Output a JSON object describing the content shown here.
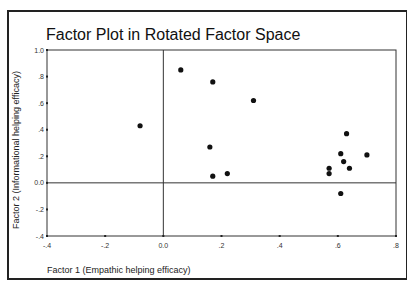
{
  "chart_data": {
    "type": "scatter",
    "title": "Factor Plot in Rotated Factor Space",
    "xlabel": "Factor 1 (Empathic helping efficacy)",
    "ylabel": "Factor 2 (Informational helping efficacy)",
    "xlim": [
      -0.4,
      0.8
    ],
    "ylim": [
      -0.4,
      1.0
    ],
    "x_ticks": [
      -0.4,
      -0.2,
      0.0,
      0.2,
      0.4,
      0.6,
      0.8
    ],
    "x_tick_labels": [
      "-.4",
      "-.2",
      "0.0",
      ".2",
      ".4",
      ".6",
      ".8"
    ],
    "y_ticks": [
      -0.4,
      -0.2,
      0.0,
      0.2,
      0.4,
      0.6,
      0.8,
      1.0
    ],
    "y_tick_labels": [
      "-.4",
      "-.2",
      "0.0",
      ".2",
      ".4",
      ".6",
      ".8",
      "1.0"
    ],
    "grid": false,
    "reference_lines": {
      "x": 0.0,
      "y": 0.0
    },
    "legend": null,
    "series": [
      {
        "name": "Items",
        "marker": "circle",
        "color": "#111111",
        "points": [
          {
            "x": -0.08,
            "y": 0.43
          },
          {
            "x": 0.06,
            "y": 0.85
          },
          {
            "x": 0.17,
            "y": 0.76
          },
          {
            "x": 0.31,
            "y": 0.62
          },
          {
            "x": 0.16,
            "y": 0.27
          },
          {
            "x": 0.17,
            "y": 0.05
          },
          {
            "x": 0.22,
            "y": 0.07
          },
          {
            "x": 0.63,
            "y": 0.37
          },
          {
            "x": 0.61,
            "y": 0.22
          },
          {
            "x": 0.7,
            "y": 0.21
          },
          {
            "x": 0.62,
            "y": 0.16
          },
          {
            "x": 0.64,
            "y": 0.11
          },
          {
            "x": 0.57,
            "y": 0.11
          },
          {
            "x": 0.57,
            "y": 0.07
          },
          {
            "x": 0.61,
            "y": -0.08
          }
        ]
      }
    ]
  },
  "layout": {
    "plot_left": 47,
    "plot_right": 396,
    "plot_top": 50,
    "plot_bottom": 236
  }
}
